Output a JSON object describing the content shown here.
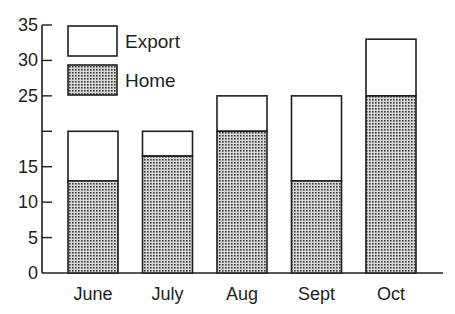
{
  "chart_data": {
    "type": "bar",
    "stacked": true,
    "title": "",
    "xlabel": "",
    "ylabel": "",
    "categories": [
      "June",
      "July",
      "Aug",
      "Sept",
      "Oct"
    ],
    "series": [
      {
        "name": "Home",
        "values": [
          13,
          16.5,
          20,
          13,
          25
        ],
        "fill": "dotted"
      },
      {
        "name": "Export",
        "values": [
          7,
          3.5,
          5,
          12,
          8
        ],
        "fill": "white"
      }
    ],
    "totals": [
      20,
      20,
      25,
      25,
      33
    ],
    "ylim": [
      0,
      35
    ],
    "yticks": [
      0,
      5,
      10,
      15,
      20,
      25,
      30,
      35
    ],
    "ytick_labels": [
      "0",
      "5",
      "10",
      "15",
      "",
      "25",
      "30",
      "35"
    ],
    "grid": false,
    "legend": {
      "position": "upper-left",
      "entries": [
        "Export",
        "Home"
      ]
    }
  },
  "colors": {
    "ink": "#1e1e1e",
    "dot_fg": "#3a3a3a",
    "dot_bg": "#d8d8d8",
    "export_fill": "#ffffff"
  }
}
